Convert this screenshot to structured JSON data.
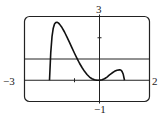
{
  "chart_data": {
    "type": "line",
    "title": "",
    "xlabel": "",
    "ylabel": "",
    "xlim": [
      -3,
      2
    ],
    "ylim": [
      -1,
      3
    ],
    "grid": false,
    "frame": "rounded-rectangle viewing window",
    "window_labels": {
      "xmin": "−3",
      "xmax": "2",
      "ymin": "−1",
      "ymax": "3"
    },
    "ticks": {
      "x": [
        -1
      ],
      "y": [
        2
      ]
    },
    "horizontal_lines": [
      0,
      1
    ],
    "series": [
      {
        "name": "f(x)",
        "x": [
          -2.0,
          -1.95,
          -1.9,
          -1.85,
          -1.8,
          -1.75,
          -1.7,
          -1.65,
          -1.6,
          -1.5,
          -1.4,
          -1.3,
          -1.2,
          -1.1,
          -1.0,
          -0.9,
          -0.8,
          -0.7,
          -0.6,
          -0.5,
          -0.4,
          -0.3,
          -0.2,
          -0.1,
          0.0,
          0.1,
          0.2,
          0.3,
          0.4,
          0.5,
          0.6,
          0.7,
          0.8,
          0.85,
          0.9,
          0.95,
          1.0
        ],
        "y": [
          0.0,
          1.3,
          2.05,
          2.45,
          2.65,
          2.72,
          2.73,
          2.7,
          2.64,
          2.48,
          2.27,
          2.03,
          1.78,
          1.52,
          1.27,
          1.03,
          0.8,
          0.6,
          0.42,
          0.27,
          0.15,
          0.07,
          0.02,
          0.0,
          0.0,
          0.02,
          0.07,
          0.15,
          0.25,
          0.34,
          0.42,
          0.47,
          0.49,
          0.48,
          0.42,
          0.28,
          0.0
        ]
      }
    ]
  }
}
